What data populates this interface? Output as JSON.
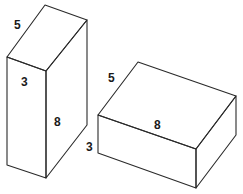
{
  "figure": {
    "boxes": [
      {
        "id": "tall-box",
        "orientation": "upright",
        "labels": {
          "depth": "5",
          "width": "3",
          "height": "8"
        },
        "dimensions": {
          "width": 3,
          "depth": 5,
          "height": 8
        }
      },
      {
        "id": "flat-box",
        "orientation": "lying",
        "labels": {
          "depth": "5",
          "length": "8",
          "height": "3"
        },
        "dimensions": {
          "length": 8,
          "depth": 5,
          "height": 3
        }
      }
    ]
  }
}
